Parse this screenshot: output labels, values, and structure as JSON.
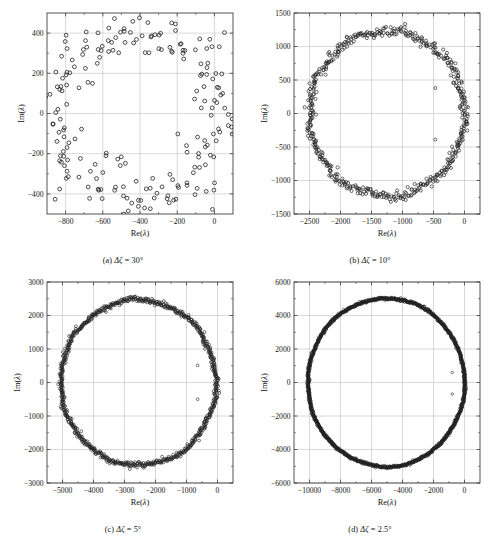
{
  "figure": {
    "panel_count": 4,
    "marker_style": "open-circle",
    "marker_color": "#222222",
    "grid_color": "#b9b9b9",
    "frame_color": "#2a2a2a",
    "background": "#ffffff"
  },
  "chart_data": [
    {
      "type": "scatter",
      "panel_id": "a",
      "title": "",
      "caption": "(a) Δζ = 30°",
      "caption_prefix": "(a)",
      "caption_symbol": "Δζ",
      "caption_value": "30°",
      "xlabel": "Re(λ)",
      "ylabel": "Im(λ)",
      "xlim": [
        -900,
        100
      ],
      "ylim": [
        -500,
        500
      ],
      "xticks": [
        -800,
        -600,
        -400,
        -200,
        0
      ],
      "yticks": [
        -400,
        -200,
        0,
        200,
        400
      ],
      "xtick_labels": [
        "−800",
        "−600",
        "−400",
        "−200",
        "0"
      ],
      "ytick_labels": [
        "−400",
        "−200",
        "0",
        "200",
        "400"
      ],
      "grid": true,
      "legend": null,
      "point_count": 220,
      "description": "Scattered ring of eigenvalues, noticeably irregular and scalloped, centered near Re = -420, mean radius about 430 with large scatter",
      "ring": {
        "center_x": -420,
        "center_y": 0,
        "radius_x": 440,
        "radius_y": 420,
        "scatter": 58,
        "density": 220,
        "marker_r": 1.9,
        "marker_style": "open-circle",
        "lobes": 8,
        "lobe_amp": 0.085
      },
      "isolated_points": []
    },
    {
      "type": "scatter",
      "panel_id": "b",
      "title": "",
      "caption": "(b) Δζ = 10°",
      "caption_prefix": "(b)",
      "caption_symbol": "Δζ",
      "caption_value": "10°",
      "xlabel": "Re(λ)",
      "ylabel": "Im(λ)",
      "xlim": [
        -2750,
        250
      ],
      "ylim": [
        -1500,
        1500
      ],
      "xticks": [
        -2500,
        -2000,
        -1500,
        -1000,
        -500,
        0
      ],
      "yticks": [
        -1500,
        -1000,
        -500,
        0,
        500,
        1000,
        1500
      ],
      "xtick_labels": [
        "−2500",
        "−2000",
        "−1500",
        "−1000",
        "−500",
        "0"
      ],
      "ytick_labels": [
        "−1500",
        "−1000",
        "−500",
        "0",
        "500",
        "1000",
        "1500"
      ],
      "grid": true,
      "legend": null,
      "point_count": 520,
      "description": "Dense near-circular ring of eigenvalues centered near Re = -1250, radius about 1250, with ragged thickening on the right side and two isolated interior points",
      "ring": {
        "center_x": -1250,
        "center_y": 0,
        "radius_x": 1255,
        "radius_y": 1230,
        "scatter": 36,
        "density": 520,
        "marker_r": 1.6,
        "marker_style": "open-circle",
        "lobes": 9,
        "lobe_amp": 0.016
      },
      "isolated_points": [
        {
          "x": -470,
          "y": 380
        },
        {
          "x": -470,
          "y": -390
        }
      ]
    },
    {
      "type": "scatter",
      "panel_id": "c",
      "title": "",
      "caption": "(c) Δζ = 5°",
      "caption_prefix": "(c)",
      "caption_symbol": "Δζ",
      "caption_value": "5°",
      "xlabel": "Re(λ)",
      "ylabel": "Im(λ)",
      "xlim": [
        -5500,
        500
      ],
      "ylim": [
        -3000,
        3000
      ],
      "xticks": [
        -5000,
        -4000,
        -3000,
        -2000,
        -1000,
        0
      ],
      "yticks": [
        -3000,
        -2000,
        -1000,
        0,
        1000,
        2000,
        3000
      ],
      "xtick_labels": [
        "−5000",
        "−4000",
        "−3000",
        "−2000",
        "−1000",
        "0"
      ],
      "ytick_labels": [
        "−3000",
        "−2000",
        "−1000",
        "0",
        "1000",
        "2000",
        "3000"
      ],
      "grid": true,
      "legend": null,
      "point_count": 900,
      "description": "Very dense circular ring centered near Re = -2550, radius about 2480, nearly continuous, with two isolated interior points near Re = -650",
      "ring": {
        "center_x": -2550,
        "center_y": 0,
        "radius_x": 2500,
        "radius_y": 2470,
        "scatter": 40,
        "density": 900,
        "marker_r": 1.45,
        "marker_style": "open-circle",
        "lobes": 7,
        "lobe_amp": 0.009
      },
      "isolated_points": [
        {
          "x": -640,
          "y": 510
        },
        {
          "x": -640,
          "y": -500
        }
      ]
    },
    {
      "type": "scatter",
      "panel_id": "d",
      "title": "",
      "caption": "(d) Δζ = 2.5°",
      "caption_prefix": "(d)",
      "caption_symbol": "Δζ",
      "caption_value": "2.5°",
      "xlabel": "Re(λ)",
      "ylabel": "Im(λ)",
      "xlim": [
        -11000,
        1000
      ],
      "ylim": [
        -6000,
        6000
      ],
      "xticks": [
        -10000,
        -8000,
        -6000,
        -4000,
        -2000,
        0
      ],
      "yticks": [
        -6000,
        -4000,
        -2000,
        0,
        2000,
        4000,
        6000
      ],
      "xtick_labels": [
        "−10000",
        "−8000",
        "−6000",
        "−4000",
        "−2000",
        "0"
      ],
      "ytick_labels": [
        "−6000",
        "−4000",
        "−2000",
        "0",
        "2000",
        "4000",
        "6000"
      ],
      "grid": true,
      "legend": null,
      "point_count": 1600,
      "description": "Extremely dense solid circular ring centered near Re = -5050, radius about 5050, appearing as a continuous thick black circle, with two isolated interior points near Re = -800",
      "ring": {
        "center_x": -5050,
        "center_y": 0,
        "radius_x": 5060,
        "radius_y": 5030,
        "scatter": 38,
        "density": 1600,
        "marker_r": 1.35,
        "marker_style": "open-circle",
        "lobes": 5,
        "lobe_amp": 0.004
      },
      "isolated_points": [
        {
          "x": -790,
          "y": 600
        },
        {
          "x": -790,
          "y": -690
        },
        {
          "x": -10050,
          "y": 80
        }
      ]
    }
  ]
}
